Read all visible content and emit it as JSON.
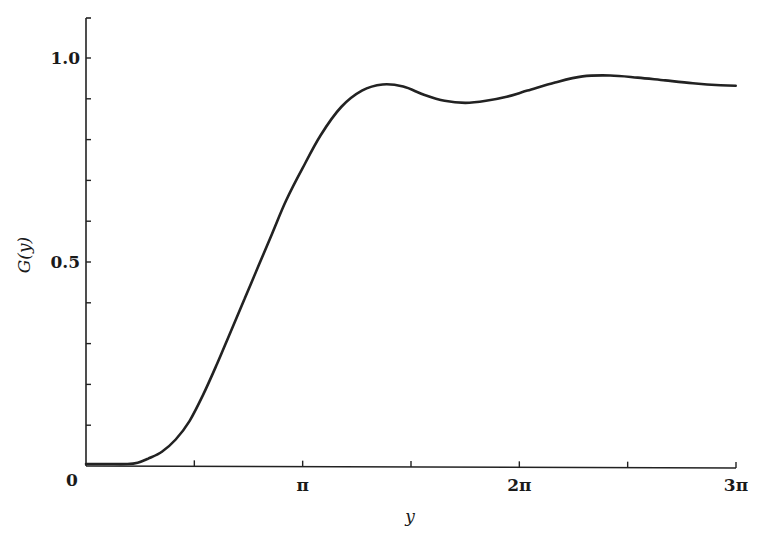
{
  "chart_data": {
    "type": "line",
    "title": "",
    "xlabel": "y",
    "ylabel": "G(y)",
    "xlim": [
      0,
      9.42478
    ],
    "ylim": [
      0,
      1.1
    ],
    "grid": false,
    "legend": null,
    "x_ticks": [
      {
        "value": 0,
        "label": "0"
      },
      {
        "value": 1.5708,
        "label": ""
      },
      {
        "value": 3.14159,
        "label": "π"
      },
      {
        "value": 4.71239,
        "label": ""
      },
      {
        "value": 6.28319,
        "label": "2π"
      },
      {
        "value": 7.85398,
        "label": ""
      },
      {
        "value": 9.42478,
        "label": "3π"
      }
    ],
    "y_ticks": [
      {
        "value": 0,
        "label": "0"
      },
      {
        "value": 0.1,
        "label": ""
      },
      {
        "value": 0.2,
        "label": ""
      },
      {
        "value": 0.3,
        "label": ""
      },
      {
        "value": 0.4,
        "label": ""
      },
      {
        "value": 0.5,
        "label": "0.5"
      },
      {
        "value": 0.6,
        "label": ""
      },
      {
        "value": 0.7,
        "label": ""
      },
      {
        "value": 0.8,
        "label": ""
      },
      {
        "value": 0.9,
        "label": ""
      },
      {
        "value": 1.0,
        "label": "1.0"
      }
    ],
    "series": [
      {
        "name": "G(y)",
        "x": [
          0,
          0.3,
          0.6,
          0.75,
          0.9,
          1.1,
          1.3,
          1.5,
          1.7,
          1.9,
          2.1,
          2.3,
          2.5,
          2.7,
          2.9,
          3.14,
          3.4,
          3.7,
          4.0,
          4.3,
          4.6,
          4.9,
          5.2,
          5.5,
          5.8,
          6.1,
          6.4,
          6.8,
          7.2,
          7.6,
          8.0,
          8.4,
          8.8,
          9.2,
          9.42
        ],
        "y": [
          0.005,
          0.005,
          0.005,
          0.008,
          0.018,
          0.035,
          0.065,
          0.11,
          0.175,
          0.25,
          0.33,
          0.41,
          0.49,
          0.57,
          0.65,
          0.73,
          0.81,
          0.88,
          0.92,
          0.935,
          0.93,
          0.91,
          0.895,
          0.89,
          0.895,
          0.905,
          0.92,
          0.94,
          0.955,
          0.957,
          0.952,
          0.945,
          0.938,
          0.933,
          0.932
        ]
      }
    ]
  },
  "axes": {
    "x_title": "y",
    "y_title": "G(y)",
    "origin_label": "0",
    "x_tick_labels": [
      "π",
      "2π",
      "3π"
    ],
    "y_tick_labels": [
      "0.5",
      "1.0"
    ]
  }
}
